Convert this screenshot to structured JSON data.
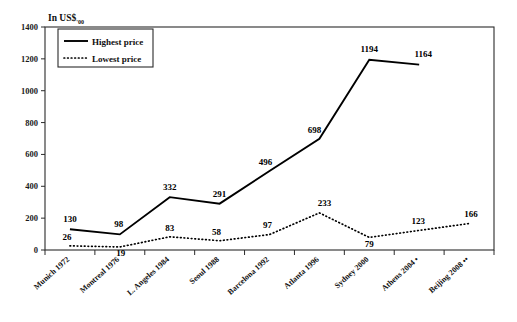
{
  "chart_data": {
    "type": "line",
    "title": "In US$'00",
    "title_main": "In US$",
    "title_sub": "'00",
    "xlabel": "",
    "ylabel": "",
    "ylim": [
      0,
      1400
    ],
    "ytick_step": 200,
    "yticks": [
      "0",
      "200",
      "400",
      "600",
      "800",
      "1000",
      "1200",
      "1400"
    ],
    "grid": false,
    "legend_position": "top-left",
    "categories": [
      "Munich 1972",
      "Montreal 1976",
      "L. Angeles 1984",
      "Seoul 1988",
      "Barcelona 1992",
      "Atlanta 1996",
      "Sydney 2000",
      "Athens 2004 •",
      "Beijing 2008 ••"
    ],
    "series": [
      {
        "name": "Highest price",
        "style": "solid",
        "values": [
          130,
          98,
          332,
          291,
          496,
          698,
          1194,
          1164,
          null
        ],
        "labels": [
          "130",
          "98",
          "332",
          "291",
          "496",
          "698",
          "1194",
          "1164",
          ""
        ]
      },
      {
        "name": "Lowest price",
        "style": "dotted",
        "values": [
          26,
          19,
          83,
          58,
          97,
          233,
          79,
          123,
          166
        ],
        "labels": [
          "26",
          "19",
          "83",
          "58",
          "97",
          "233",
          "79",
          "123",
          "166"
        ]
      }
    ],
    "legend": [
      {
        "label": "Highest price",
        "style": "solid"
      },
      {
        "label": "Lowest price",
        "style": "dotted"
      }
    ]
  }
}
